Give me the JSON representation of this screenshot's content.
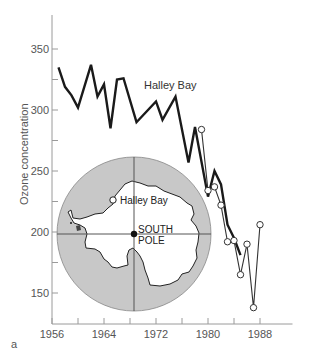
{
  "panel_label": "a",
  "colors": {
    "axis": "#9a9a9a",
    "line_thick": "#1a1a1a",
    "line_thin": "#333333",
    "map_ocean": "#c8c8c8",
    "map_land": "#ffffff"
  },
  "chart_data": {
    "type": "line",
    "title": "",
    "xlabel": "",
    "ylabel": "Ozone concentration",
    "xlim": [
      1956,
      1993
    ],
    "ylim": [
      130,
      375
    ],
    "x_ticks": [
      1956,
      1960,
      1964,
      1968,
      1972,
      1976,
      1980,
      1984,
      1988
    ],
    "x_tick_labels": [
      "1956",
      "1964",
      "1972",
      "1980",
      "1988"
    ],
    "y_ticks": [
      150,
      175,
      200,
      225,
      250,
      275,
      300,
      325,
      350
    ],
    "y_tick_labels": [
      "150",
      "200",
      "250",
      "300",
      "350"
    ],
    "grid": false,
    "legend": null,
    "series": [
      {
        "name": "Halley Bay",
        "style": "thick line",
        "x": [
          1957,
          1958,
          1959,
          1960,
          1962,
          1963,
          1964,
          1965,
          1966,
          1967,
          1969,
          1972,
          1973,
          1975,
          1977,
          1978,
          1980,
          1981,
          1982,
          1983,
          1984,
          1985
        ],
        "values": [
          335,
          319,
          312,
          302,
          337,
          311,
          321,
          285,
          325,
          326,
          290,
          307,
          292,
          311,
          257,
          286,
          229,
          250,
          239,
          206,
          195,
          181
        ]
      },
      {
        "name": "Halley Bay (open circles)",
        "style": "thin line with open circle markers",
        "x": [
          1979,
          1980,
          1981,
          1982,
          1983,
          1984,
          1985,
          1986,
          1987,
          1988
        ],
        "values": [
          284,
          234,
          237,
          222,
          192,
          193,
          165,
          190,
          138,
          206
        ]
      }
    ],
    "annotations": [
      {
        "text": "Halley Bay",
        "x": 1975,
        "y": 322
      }
    ],
    "inset_map": {
      "description": "Antarctica polar map",
      "labels": [
        "Halley Bay",
        "SOUTH",
        "POLE"
      ]
    }
  }
}
